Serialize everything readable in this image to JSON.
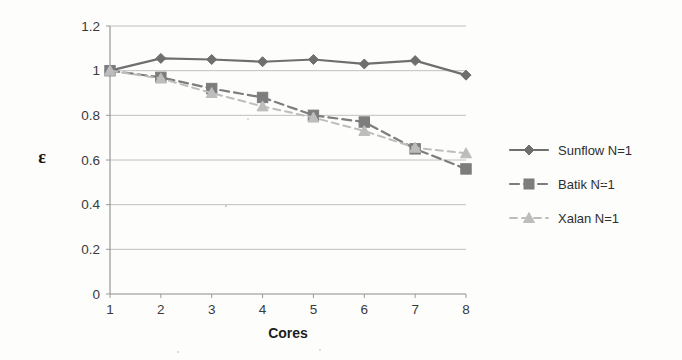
{
  "chart_data": {
    "type": "line",
    "title": "",
    "subtitle": "",
    "xlabel": "Cores",
    "ylabel": "ε",
    "x": [
      1,
      2,
      3,
      4,
      5,
      6,
      7,
      8
    ],
    "xtick_labels": [
      "1",
      "2",
      "3",
      "4",
      "5",
      "6",
      "7",
      "8"
    ],
    "ytick_labels": [
      "0",
      "0.2",
      "0.4",
      "0.6",
      "0.8",
      "1",
      "1.2"
    ],
    "ytick_values": [
      0,
      0.2,
      0.4,
      0.6,
      0.8,
      1,
      1.2
    ],
    "xlim": [
      1,
      8
    ],
    "ylim": [
      0,
      1.2
    ],
    "grid": "horizontal",
    "legend_position": "right",
    "series": [
      {
        "name": "Sunflow N=1",
        "marker": "diamond",
        "linestyle": "solid",
        "color": "#6f6f6f",
        "values": [
          1.0,
          1.055,
          1.05,
          1.04,
          1.05,
          1.03,
          1.045,
          0.98
        ]
      },
      {
        "name": "Batik N=1",
        "marker": "square",
        "linestyle": "dashed",
        "color": "#7d7d7d",
        "values": [
          1.0,
          0.97,
          0.92,
          0.88,
          0.8,
          0.77,
          0.65,
          0.56
        ]
      },
      {
        "name": "Xalan N=1",
        "marker": "triangle",
        "linestyle": "dashed",
        "color": "#bdbdbd",
        "values": [
          1.0,
          0.965,
          0.9,
          0.84,
          0.79,
          0.73,
          0.655,
          0.63
        ]
      }
    ]
  },
  "axes": {
    "y_axis_title": "ε",
    "x_axis_title": "Cores"
  },
  "legend": {
    "entries": [
      {
        "label": "Sunflow N=1",
        "marker": "diamond-marker-icon",
        "color": "#6f6f6f",
        "style": "solid"
      },
      {
        "label": "Batik N=1",
        "marker": "square-marker-icon",
        "color": "#7d7d7d",
        "style": "dashed"
      },
      {
        "label": "Xalan N=1",
        "marker": "triangle-marker-icon",
        "color": "#bdbdbd",
        "style": "dashed"
      }
    ]
  },
  "colors": {
    "background": "#fdfdfc",
    "gridline": "#b9b9b9",
    "axis": "#8e8e8e",
    "text": "#2b2b2b",
    "series_sunflow": "#6f6f6f",
    "series_batik": "#7d7d7d",
    "series_xalan": "#bdbdbd"
  }
}
